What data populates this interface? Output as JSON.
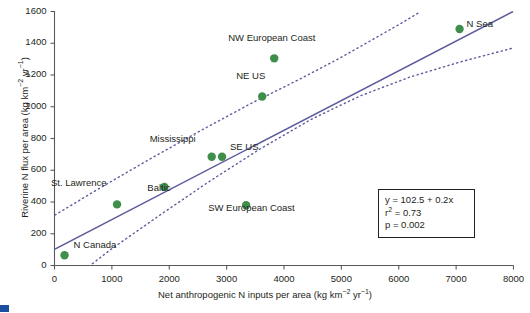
{
  "chart_data": {
    "type": "scatter",
    "title": "",
    "xlabel": "Net anthropogenic N inputs per area (kg km−2 yr−1)",
    "ylabel": "Riverine N flux per area (kg km−2 yr−1)",
    "xlim": [
      0,
      8000
    ],
    "ylim": [
      0,
      1600
    ],
    "xticks": [
      0,
      1000,
      2000,
      3000,
      4000,
      5000,
      6000,
      7000,
      8000
    ],
    "yticks": [
      0,
      200,
      400,
      600,
      800,
      1000,
      1200,
      1400,
      1600
    ],
    "grid": false,
    "legend": "none",
    "point_color": "#3f8f4a",
    "line_color": "#5b5b9e",
    "points": [
      {
        "label": "N Canada",
        "x": 175,
        "y": 65,
        "label_dx": 9,
        "label_dy": -4
      },
      {
        "label": "St. Lawrence",
        "x": 1090,
        "y": 385,
        "label_dx": -66,
        "label_dy": -15
      },
      {
        "label": "Baltic",
        "x": 1915,
        "y": 495,
        "label_dx": -17,
        "label_dy": 7
      },
      {
        "label": "Mississippi",
        "x": 2740,
        "y": 685,
        "label_dx": -62,
        "label_dy": -12
      },
      {
        "label": "SE US",
        "x": 2920,
        "y": 685,
        "label_dx": 8,
        "label_dy": -4
      },
      {
        "label": "SW European Coast",
        "x": 3340,
        "y": 380,
        "label_dx": -38,
        "label_dy": 9
      },
      {
        "label": "NE US",
        "x": 3620,
        "y": 1065,
        "label_dx": -26,
        "label_dy": -14
      },
      {
        "label": "NW European Coast",
        "x": 3830,
        "y": 1305,
        "label_dx": -46,
        "label_dy": -14
      },
      {
        "label": "N Sea",
        "x": 7060,
        "y": 1490,
        "label_dx": 7,
        "label_dy": 1
      }
    ],
    "fit": {
      "equation": "y = 102.5 + 0.2x",
      "r2": "r² = 0.73",
      "p": "p = 0.002",
      "intercept": 102.5,
      "slope": 0.2,
      "confidence_bands": "dotted upper and lower prediction intervals"
    },
    "annotations": {
      "equation_box_lines": [
        "y = 102.5 + 0.2x",
        "r² = 0.73",
        "p = 0.002"
      ]
    }
  },
  "axes": {
    "x": {
      "title": "Net anthropogenic N inputs per area (kg km",
      "title_sup1": "−2",
      "title_mid": " yr",
      "title_sup2": "−1",
      "title_end": ")",
      "ticklabels": [
        "0",
        "1000",
        "2000",
        "3000",
        "4000",
        "5000",
        "6000",
        "7000",
        "8000"
      ]
    },
    "y": {
      "title": "Riverine N flux per area (kg km",
      "title_sup1": "−2",
      "title_mid": " yr",
      "title_sup2": "−1",
      "title_end": ")",
      "ticklabels": [
        "0",
        "200",
        "400",
        "600",
        "800",
        "1000",
        "1200",
        "1400",
        "1600"
      ]
    }
  },
  "equation_box": {
    "line1": "y = 102.5 + 0.2x",
    "line2_pre": "r",
    "line2_sup": "2",
    "line2_post": " = 0.73",
    "line3": "p = 0.002"
  },
  "colors": {
    "point": "#3f8f4a",
    "line": "#5b5b9e",
    "axis": "#58595b",
    "text": "#231f20",
    "caption": "#1a4fa0"
  }
}
